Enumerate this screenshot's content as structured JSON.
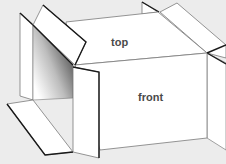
{
  "diagram": {
    "labels": {
      "top": "top",
      "front": "front"
    },
    "colors": {
      "background": "#ececec",
      "face": "#ffffff",
      "thin_line": "#7a7a7a",
      "thick_line": "#1a1a1a",
      "label": "#4a4a4a",
      "shadow_dark": "#555555"
    }
  }
}
